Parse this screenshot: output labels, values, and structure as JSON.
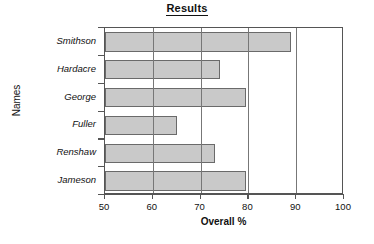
{
  "chart_data": {
    "type": "bar",
    "orientation": "horizontal",
    "title": "Results",
    "xlabel": "Overall %",
    "ylabel": "Names",
    "categories": [
      "Smithson",
      "Hardacre",
      "George",
      "Fuller",
      "Renshaw",
      "Jameson"
    ],
    "values": [
      89,
      74,
      79.5,
      65,
      73,
      79.5
    ],
    "xlim": [
      50,
      100
    ],
    "xticks": [
      50,
      60,
      70,
      80,
      90,
      100
    ],
    "xtick_labels": [
      "50",
      "60",
      "70",
      "80",
      "90",
      "100"
    ],
    "gridlines_x": [
      60,
      70,
      80,
      90
    ],
    "grid": true,
    "legend": false,
    "bar_fill_color": "#c9c9c9",
    "bar_edge_color": "#6a6a6a",
    "axis_color": "#555555",
    "grid_color": "#777777"
  },
  "bars": [
    {
      "label": "Smithson",
      "value": 89
    },
    {
      "label": "Hardacre",
      "value": 74
    },
    {
      "label": "George",
      "value": 79.5
    },
    {
      "label": "Fuller",
      "value": 65
    },
    {
      "label": "Renshaw",
      "value": 73
    },
    {
      "label": "Jameson",
      "value": 79.5
    }
  ],
  "xticks": [
    {
      "label": "50",
      "value": 50
    },
    {
      "label": "60",
      "value": 60
    },
    {
      "label": "70",
      "value": 70
    },
    {
      "label": "80",
      "value": 80
    },
    {
      "label": "90",
      "value": 90
    },
    {
      "label": "100",
      "value": 100
    }
  ]
}
